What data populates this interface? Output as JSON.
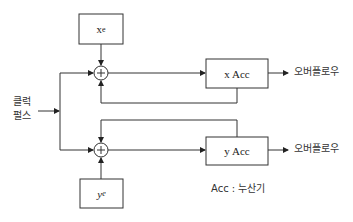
{
  "diagram": {
    "type": "block-diagram",
    "blocks": {
      "xe": {
        "label": "x",
        "subscript": "e"
      },
      "ye": {
        "label": "y",
        "subscript": "e"
      },
      "x_acc": {
        "label": "x Acc"
      },
      "y_acc": {
        "label": "y Acc"
      }
    },
    "adders": [
      {
        "id": "top-adder",
        "symbol": "+"
      },
      {
        "id": "bottom-adder",
        "symbol": "+"
      }
    ],
    "input": {
      "line1": "클럭",
      "line2": "펄스"
    },
    "outputs": {
      "x": "오버플로우",
      "y": "오버플로우"
    },
    "legend": "Acc : 누산기",
    "colors": {
      "stroke": "#333333",
      "text": "#222222",
      "background": "#ffffff"
    }
  }
}
